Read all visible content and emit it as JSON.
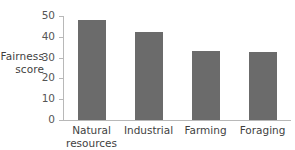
{
  "chart_data": {
    "type": "bar",
    "title": "",
    "subtitle": "",
    "xlabel": "",
    "ylabel": "Fairness score",
    "ylabel_lines": [
      "Fairness",
      "score"
    ],
    "categories": [
      "Natural resources",
      "Industrial",
      "Farming",
      "Foraging"
    ],
    "category_lines": [
      [
        "Natural",
        "resources"
      ],
      [
        "Industrial"
      ],
      [
        "Farming"
      ],
      [
        "Foraging"
      ]
    ],
    "values": [
      48,
      42.5,
      33,
      32.5
    ],
    "ylim": [
      0,
      50
    ],
    "yticks": [
      0,
      10,
      20,
      30,
      40,
      50
    ],
    "ytick_labels": [
      "0",
      "10",
      "20",
      "30",
      "40",
      "50"
    ],
    "xticks_visible": false,
    "grid": false,
    "legend": null,
    "legend_position": "none",
    "colors": {
      "bar": "#6b6b6b",
      "axis": "#b8b8b8",
      "text": "#3f3f3f",
      "tick_text": "#555555",
      "background": "#ffffff"
    }
  }
}
